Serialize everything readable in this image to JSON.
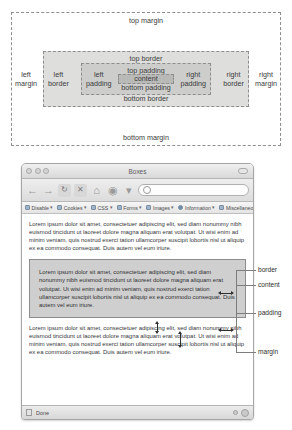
{
  "box_model_diagram": {
    "margin": {
      "top": "top margin",
      "bottom": "bottom margin",
      "left": "left\nmargin",
      "left_line1": "left",
      "left_line2": "margin",
      "right_line1": "right",
      "right_line2": "margin"
    },
    "border": {
      "top": "top border",
      "bottom": "bottom border",
      "left_line1": "left",
      "left_line2": "border",
      "right_line1": "right",
      "right_line2": "border"
    },
    "padding": {
      "top": "top padding",
      "bottom": "bottom padding",
      "left_line1": "left",
      "left_line2": "padding",
      "right_line1": "right",
      "right_line2": "padding"
    },
    "content": {
      "label": "content"
    },
    "colors": {
      "margin_fill": "#ffffff",
      "border_fill": "#dededd",
      "padding_fill": "#cdcdcc",
      "content_fill": "#b9b9b8",
      "dash_stroke": "#8e8e8e"
    }
  },
  "browser": {
    "window_title": "Boxes",
    "traffic_lights": [
      "close-button",
      "minimize-button",
      "zoom-button"
    ],
    "toolbar": {
      "back_label": "←",
      "forward_label": "→",
      "reload_label": "↻",
      "stop_label": "✕",
      "home_label": "⌂",
      "bookmarks_label": "◉",
      "caret_label": "▾",
      "url_value": "",
      "url_placeholder": ""
    },
    "devtoolbar": {
      "items": [
        {
          "label": "Disable",
          "caret": "▾"
        },
        {
          "label": "Cookies",
          "caret": "▾"
        },
        {
          "label": "CSS",
          "caret": "▾"
        },
        {
          "label": "Forms",
          "caret": "▾"
        },
        {
          "label": "Images",
          "caret": "▾"
        },
        {
          "label": "Information",
          "caret": "▾"
        },
        {
          "label": "Miscellaneous",
          "caret": "▾"
        }
      ]
    },
    "page": {
      "paragraph_top": "Lorem ipsum dolor sit amet, consectetuer adipiscing elit, sed diam nonummy nibh euismod tincidunt ut laoreet dolore magna aliquam erat volutpat. Ut wisi enim ad minim veniam, quis nostrud exerci tation ullamcorper suscipit lobortis nisl ut aliquip ex ea commodo consequat. Duis autem vel eum iriure.",
      "paragraph_boxed": "Lorem ipsum dolor sit amet, consectetuer adipiscing elit, sed diam nonummy nibh euismod tincidunt ut laoreet dolore magna aliquam erat volutpat. Ut wisi enim ad minim veniam, quis nostrud exerci tation ullamcorper suscipit lobortis nisl ut aliquip ex ea commodo consequat. Duis autem vel eum iriure.",
      "paragraph_bottom": "Lorem ipsum dolor sit amet, consectetuer adipiscing elit, sed diam nonummy nibh euismod tincidunt ut laoreet dolore magna aliquam erat volutpat. Ut wisi enim ad minim veniam, quis nostrud exerci tation ullamcorper suscipit lobortis nisl ut aliquip ex ea commodo consequat. Duis autem vel eum iriure."
    },
    "statusbar": {
      "status_text": "Done"
    }
  },
  "callouts": {
    "border": "border",
    "content": "content",
    "padding": "padding",
    "margin": "margin"
  }
}
